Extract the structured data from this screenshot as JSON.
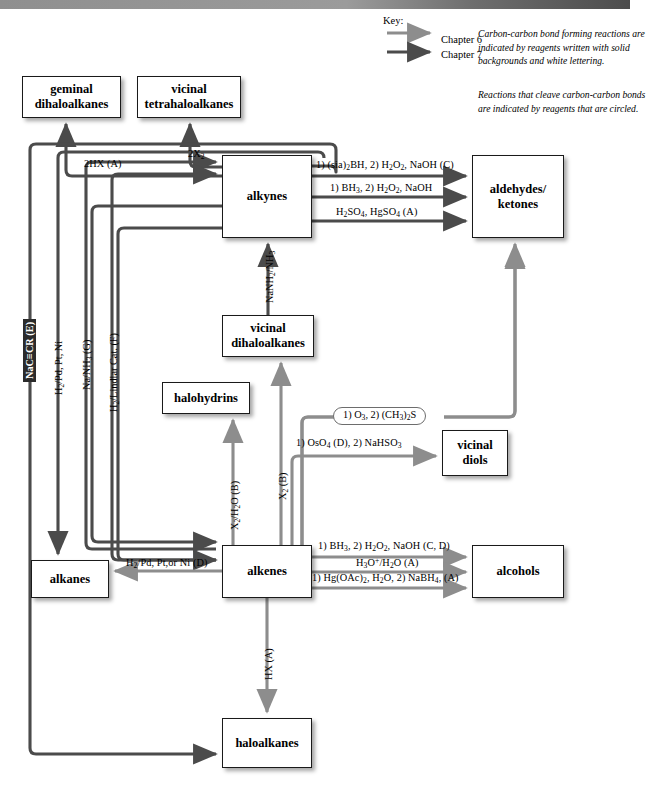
{
  "page": {
    "width": 630,
    "height": 812
  },
  "colors": {
    "chapter6": "#8d8d8d",
    "chapter7": "#4b4b4b",
    "box_border": "#1a1a1a",
    "solid_tag_bg": "#2b2b2b",
    "solid_tag_text": "#ffffff",
    "circle_stroke": "#6d6d6d",
    "background": "#ffffff"
  },
  "key": {
    "title": "Key:",
    "entries": [
      {
        "label": "Chapter 6",
        "color": "#8d8d8d"
      },
      {
        "label": "Chapter 7",
        "color": "#4b4b4b"
      }
    ]
  },
  "notes": [
    "Carbon-carbon bond forming reactions are indicated by reagents written with solid backgrounds and white lettering.",
    "Reactions that cleave carbon-carbon bonds are indicated by reagents that are circled."
  ],
  "nodes": [
    {
      "id": "geminal",
      "label": "geminal\ndihaloalkanes",
      "x": 22,
      "y": 76,
      "w": 99,
      "h": 42
    },
    {
      "id": "vicinaltetra",
      "label": "vicinal\ntetrahaloalkanes",
      "x": 137,
      "y": 76,
      "w": 104,
      "h": 42
    },
    {
      "id": "alkynes",
      "label": "alkynes",
      "x": 222,
      "y": 155,
      "w": 90,
      "h": 83
    },
    {
      "id": "aldketones",
      "label": "aldehydes/\nketones",
      "x": 472,
      "y": 155,
      "w": 92,
      "h": 83
    },
    {
      "id": "vicinaldi",
      "label": "vicinal\ndihaloalkanes",
      "x": 222,
      "y": 315,
      "w": 92,
      "h": 42
    },
    {
      "id": "halohydrins",
      "label": "halohydrins",
      "x": 162,
      "y": 382,
      "w": 88,
      "h": 32
    },
    {
      "id": "vicinaldiols",
      "label": "vicinal\ndiols",
      "x": 442,
      "y": 430,
      "w": 66,
      "h": 46
    },
    {
      "id": "alkenes",
      "label": "alkenes",
      "x": 222,
      "y": 545,
      "w": 90,
      "h": 53
    },
    {
      "id": "alkanes",
      "label": "alkanes",
      "x": 31,
      "y": 560,
      "w": 78,
      "h": 38
    },
    {
      "id": "alcohols",
      "label": "alcohols",
      "x": 472,
      "y": 545,
      "w": 92,
      "h": 53
    },
    {
      "id": "haloalkanes",
      "label": "haloalkanes",
      "x": 222,
      "y": 718,
      "w": 90,
      "h": 50
    }
  ],
  "reactions": {
    "alkyne_to_geminal": {
      "label": "2HX (A)",
      "chapter": 7
    },
    "alkyne_to_vtetra": {
      "label": "2X₂",
      "chapter": 7
    },
    "alkyne_hydrobor_sia": {
      "label": "1) (sia)₂BH, 2) H₂O₂, NaOH (C)",
      "chapter": 7
    },
    "alkyne_hydrobor_bh3": {
      "label": "1) BH₃, 2) H₂O₂, NaOH",
      "chapter": 7
    },
    "alkyne_hydration": {
      "label": "H₂SO₄, HgSO₄ (A)",
      "chapter": 7
    },
    "vicdi_to_alkyne": {
      "label": "NaNH₂/NH₃",
      "chapter": 7
    },
    "alkene_to_vicdi": {
      "label": "X₂ (B)",
      "chapter": 6
    },
    "alkene_to_halohydrin": {
      "label": "X₂/H₂O (B)",
      "chapter": 6
    },
    "alkene_ozonolysis": {
      "label": "1) O₃,  2) (CH₃)₂S",
      "chapter": 6,
      "circled": true
    },
    "alkene_dihydroxy": {
      "label": "1) OsO₄ (D),  2) NaHSO₃",
      "chapter": 6
    },
    "alkene_hydrobor": {
      "label": "1) BH₃, 2) H₂O₂, NaOH (C, D)",
      "chapter": 6
    },
    "alkene_hydration": {
      "label": "H₃O⁺/H₂O (A)",
      "chapter": 6
    },
    "alkene_oxymerc": {
      "label": "1) Hg(OAc)₂, H₂O, 2) NaBH₄, (A)",
      "chapter": 6
    },
    "alkene_to_alkane": {
      "label": "H₂/Pd, Pt,or Ni (D)",
      "chapter": 6
    },
    "alkene_to_halo": {
      "label": "HX (A)",
      "chapter": 6
    },
    "acetylide": {
      "label": "NaC≡CR (E)",
      "chapter": 7,
      "solid_tag": true
    },
    "alkyne_hydrogenation": {
      "label": "H₂/Pd, Pt, Ni",
      "chapter": 7
    },
    "alkyne_na_nh3": {
      "label": "Na/NH₃ (G)",
      "chapter": 7
    },
    "alkyne_lindlar": {
      "label": "H₂/Lindlar Cat. (F)",
      "chapter": 7
    }
  }
}
